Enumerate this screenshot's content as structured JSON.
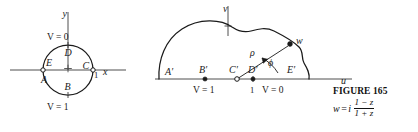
{
  "figure": {
    "left_plane": {
      "axis_y_label": "y",
      "axis_x_label": "x",
      "boundary_top_label": "V = 0",
      "boundary_bottom_label": "V = 1",
      "tick_label": "1",
      "interior_mark": "+",
      "points": [
        {
          "id": "D",
          "label": "D",
          "marker": "none"
        },
        {
          "id": "C",
          "label": "C",
          "marker": "open-circle"
        },
        {
          "id": "B",
          "label": "B",
          "marker": "none"
        },
        {
          "id": "A",
          "label": "A",
          "marker": "none"
        },
        {
          "id": "E",
          "label": "E",
          "marker": "open-circle"
        }
      ]
    },
    "right_plane": {
      "axis_v_label": "v",
      "axis_u_label": "u",
      "boundary_left_label": "V = 1",
      "boundary_right_label": "V = 0",
      "tick_label": "1",
      "radius_label": "ρ",
      "angle_label": "ϕ",
      "point_label": "w",
      "points": [
        {
          "id": "A-prime",
          "label": "A′",
          "marker": "none"
        },
        {
          "id": "B-prime",
          "label": "B′",
          "marker": "filled-dot"
        },
        {
          "id": "C-prime",
          "label": "C′",
          "marker": "open-circle"
        },
        {
          "id": "D-prime",
          "label": "D′",
          "marker": "filled-dot"
        },
        {
          "id": "E-prime",
          "label": "E′",
          "marker": "none"
        },
        {
          "id": "w",
          "label": "w",
          "marker": "filled-dot"
        }
      ]
    },
    "caption": {
      "title": "FIGURE 165",
      "formula_lhs": "w",
      "formula_eq": "=",
      "formula_i": "i",
      "formula_numerator": "1 − z",
      "formula_denominator": "1 + z"
    }
  }
}
